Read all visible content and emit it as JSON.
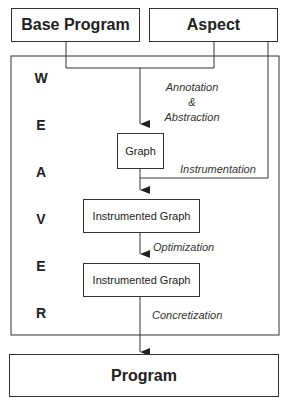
{
  "inputs": {
    "base_program": "Base Program",
    "aspect": "Aspect"
  },
  "weaver": {
    "letters": [
      "W",
      "E",
      "A",
      "V",
      "E",
      "R"
    ]
  },
  "nodes": {
    "graph": "Graph",
    "instrumented_graph_1": "Instrumented Graph",
    "instrumented_graph_2": "Instrumented Graph"
  },
  "edges": {
    "annotation_line1": "Annotation",
    "annotation_line2": "&",
    "annotation_line3": "Abstraction",
    "instrumentation": "Instrumentation",
    "optimization": "Optimization",
    "concretization": "Concretization"
  },
  "output": {
    "program": "Program"
  }
}
